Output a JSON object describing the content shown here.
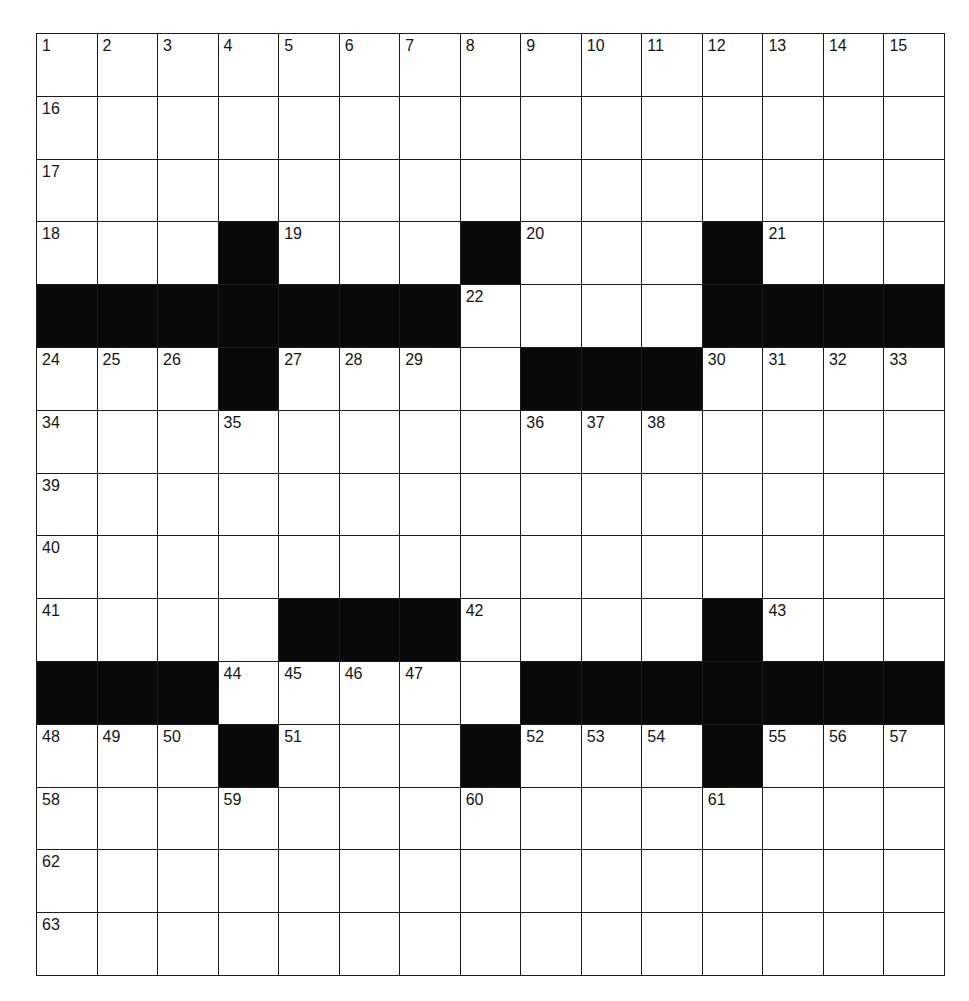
{
  "puzzle": {
    "rows": 15,
    "cols": 15,
    "colors": {
      "block": "#0a0a0a",
      "cell": "#ffffff",
      "line": "#1a1a1a",
      "number": "#151515"
    },
    "layout": [
      "...............",
      "...............",
      "...............",
      "...#...#...#...",
      "#######....####",
      "...#....###....",
      "...............",
      "...............",
      "...............",
      "....###....#...",
      "###.....#######",
      "...#...#...#...",
      "...............",
      "...............",
      "..............."
    ],
    "numbers": [
      [
        "1",
        "2",
        "3",
        "4",
        "5",
        "6",
        "7",
        "8",
        "9",
        "10",
        "11",
        "12",
        "13",
        "14",
        "15"
      ],
      [
        "16",
        "",
        "",
        "",
        "",
        "",
        "",
        "",
        "",
        "",
        "",
        "",
        "",
        "",
        ""
      ],
      [
        "17",
        "",
        "",
        "",
        "",
        "",
        "",
        "",
        "",
        "",
        "",
        "",
        "",
        "",
        ""
      ],
      [
        "18",
        "",
        "",
        "",
        "19",
        "",
        "",
        "",
        "20",
        "",
        "",
        "",
        "21",
        "",
        ""
      ],
      [
        "",
        "",
        "",
        "",
        "",
        "",
        "",
        "22",
        "",
        "",
        "",
        "23",
        "",
        "",
        ""
      ],
      [
        "24",
        "25",
        "26",
        "",
        "27",
        "28",
        "29",
        "",
        "",
        "",
        "",
        "30",
        "31",
        "32",
        "33"
      ],
      [
        "34",
        "",
        "",
        "35",
        "",
        "",
        "",
        "",
        "36",
        "37",
        "38",
        "",
        "",
        "",
        ""
      ],
      [
        "39",
        "",
        "",
        "",
        "",
        "",
        "",
        "",
        "",
        "",
        "",
        "",
        "",
        "",
        ""
      ],
      [
        "40",
        "",
        "",
        "",
        "",
        "",
        "",
        "",
        "",
        "",
        "",
        "",
        "",
        "",
        ""
      ],
      [
        "41",
        "",
        "",
        "",
        "",
        "",
        "",
        "42",
        "",
        "",
        "",
        "",
        "43",
        "",
        ""
      ],
      [
        "",
        "",
        "",
        "44",
        "45",
        "46",
        "47",
        "",
        "",
        "",
        "",
        "",
        "",
        "",
        ""
      ],
      [
        "48",
        "49",
        "50",
        "",
        "51",
        "",
        "",
        "",
        "52",
        "53",
        "54",
        "",
        "55",
        "56",
        "57"
      ],
      [
        "58",
        "",
        "",
        "59",
        "",
        "",
        "",
        "60",
        "",
        "",
        "",
        "61",
        "",
        "",
        ""
      ],
      [
        "62",
        "",
        "",
        "",
        "",
        "",
        "",
        "",
        "",
        "",
        "",
        "",
        "",
        "",
        ""
      ],
      [
        "63",
        "",
        "",
        "",
        "",
        "",
        "",
        "",
        "",
        "",
        "",
        "",
        "",
        "",
        ""
      ]
    ],
    "letters": [
      [
        "",
        "",
        "",
        "",
        "",
        "",
        "",
        "",
        "",
        "",
        "",
        "",
        "",
        "",
        ""
      ],
      [
        "",
        "",
        "",
        "",
        "",
        "",
        "",
        "",
        "",
        "",
        "",
        "",
        "",
        "",
        ""
      ],
      [
        "",
        "",
        "",
        "",
        "",
        "",
        "",
        "",
        "",
        "",
        "",
        "",
        "",
        "",
        ""
      ],
      [
        "",
        "",
        "",
        "",
        "",
        "",
        "",
        "",
        "",
        "",
        "",
        "",
        "",
        "",
        ""
      ],
      [
        "",
        "",
        "",
        "",
        "",
        "",
        "",
        "",
        "",
        "",
        "",
        "",
        "",
        "",
        ""
      ],
      [
        "",
        "",
        "",
        "",
        "",
        "",
        "",
        "",
        "",
        "",
        "",
        "",
        "",
        "",
        ""
      ],
      [
        "",
        "",
        "",
        "",
        "",
        "",
        "",
        "",
        "",
        "",
        "",
        "",
        "",
        "",
        ""
      ],
      [
        "",
        "",
        "",
        "",
        "",
        "",
        "",
        "",
        "",
        "",
        "",
        "",
        "",
        "",
        ""
      ],
      [
        "",
        "",
        "",
        "",
        "",
        "",
        "",
        "",
        "",
        "",
        "",
        "",
        "",
        "",
        ""
      ],
      [
        "",
        "",
        "",
        "",
        "",
        "",
        "",
        "",
        "",
        "",
        "",
        "",
        "",
        "",
        ""
      ],
      [
        "",
        "",
        "",
        "",
        "",
        "",
        "",
        "",
        "",
        "",
        "",
        "",
        "",
        "",
        ""
      ],
      [
        "",
        "",
        "",
        "",
        "",
        "",
        "",
        "",
        "",
        "",
        "",
        "",
        "",
        "",
        ""
      ],
      [
        "",
        "",
        "",
        "",
        "",
        "",
        "",
        "",
        "",
        "",
        "",
        "",
        "",
        "",
        ""
      ],
      [
        "",
        "",
        "",
        "",
        "",
        "",
        "",
        "",
        "",
        "",
        "",
        "",
        "",
        "",
        ""
      ],
      [
        "",
        "",
        "",
        "",
        "",
        "",
        "",
        "",
        "",
        "",
        "",
        "",
        "",
        "",
        ""
      ]
    ]
  }
}
